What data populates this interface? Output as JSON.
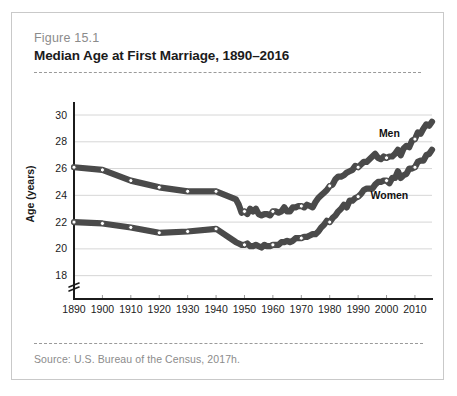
{
  "figure": {
    "number": "Figure 15.1",
    "title": "Median Age at First Marriage, 1890–2016",
    "source": "Source:  U.S. Bureau of the Census, 2017h."
  },
  "colors": {
    "line": "#4a4a4a",
    "marker_fill": "#ffffff",
    "gridline": "#d6d6d6",
    "axis": "#1b1b1b",
    "card_border": "#c9c9c9",
    "muted_text": "#8b8b8b"
  },
  "chart_data": {
    "type": "line",
    "title": "Median Age at First Marriage, 1890–2016",
    "xlabel": "",
    "ylabel": "Age (years)",
    "xlim": [
      1890,
      2016
    ],
    "ylim": [
      17,
      30.6
    ],
    "y_axis_break": true,
    "y_axis_break_note": "axis broken below 18",
    "grid": true,
    "legend": "inline-labels",
    "yticks": [
      18,
      20,
      22,
      24,
      26,
      28,
      30
    ],
    "xticks": [
      1890,
      1900,
      1910,
      1920,
      1930,
      1940,
      1950,
      1960,
      1970,
      1980,
      1990,
      2000,
      2010
    ],
    "marker_years": [
      1890,
      1900,
      1910,
      1920,
      1930,
      1940,
      1950,
      1960,
      1970,
      1980,
      1990,
      2000,
      2010
    ],
    "series": [
      {
        "name": "Men",
        "label": "Men",
        "label_year": 2001,
        "label_value": 28.6,
        "x": [
          1890,
          1900,
          1910,
          1920,
          1930,
          1940,
          1947,
          1948,
          1949,
          1950,
          1951,
          1952,
          1953,
          1954,
          1955,
          1956,
          1957,
          1958,
          1959,
          1960,
          1961,
          1962,
          1963,
          1964,
          1965,
          1966,
          1967,
          1968,
          1969,
          1970,
          1971,
          1972,
          1973,
          1974,
          1975,
          1976,
          1977,
          1978,
          1979,
          1980,
          1981,
          1982,
          1983,
          1984,
          1985,
          1986,
          1987,
          1988,
          1989,
          1990,
          1991,
          1992,
          1993,
          1994,
          1995,
          1996,
          1997,
          1998,
          1999,
          2000,
          2001,
          2002,
          2003,
          2004,
          2005,
          2006,
          2007,
          2008,
          2009,
          2010,
          2011,
          2012,
          2013,
          2014,
          2015,
          2016
        ],
        "y": [
          26.1,
          25.9,
          25.1,
          24.6,
          24.3,
          24.3,
          23.7,
          23.3,
          22.7,
          22.8,
          22.6,
          23.0,
          22.8,
          23.0,
          22.6,
          22.5,
          22.6,
          22.6,
          22.5,
          22.8,
          22.8,
          22.7,
          22.8,
          23.1,
          22.8,
          22.8,
          23.1,
          23.1,
          23.2,
          23.2,
          23.1,
          23.3,
          23.2,
          23.1,
          23.5,
          23.8,
          24.0,
          24.2,
          24.4,
          24.7,
          24.8,
          25.2,
          25.4,
          25.4,
          25.5,
          25.7,
          25.8,
          25.9,
          26.2,
          26.1,
          26.3,
          26.5,
          26.5,
          26.7,
          26.9,
          27.1,
          26.8,
          26.7,
          26.9,
          26.8,
          26.9,
          26.9,
          27.1,
          27.4,
          27.0,
          27.5,
          27.7,
          27.6,
          28.1,
          28.2,
          28.7,
          28.6,
          29.0,
          29.3,
          29.2,
          29.5
        ]
      },
      {
        "name": "Women",
        "label": "Women",
        "label_year": 2001,
        "label_value": 24.0,
        "x": [
          1890,
          1900,
          1910,
          1920,
          1930,
          1940,
          1947,
          1948,
          1949,
          1950,
          1951,
          1952,
          1953,
          1954,
          1955,
          1956,
          1957,
          1958,
          1959,
          1960,
          1961,
          1962,
          1963,
          1964,
          1965,
          1966,
          1967,
          1968,
          1969,
          1970,
          1971,
          1972,
          1973,
          1974,
          1975,
          1976,
          1977,
          1978,
          1979,
          1980,
          1981,
          1982,
          1983,
          1984,
          1985,
          1986,
          1987,
          1988,
          1989,
          1990,
          1991,
          1992,
          1993,
          1994,
          1995,
          1996,
          1997,
          1998,
          1999,
          2000,
          2001,
          2002,
          2003,
          2004,
          2005,
          2006,
          2007,
          2008,
          2009,
          2010,
          2011,
          2012,
          2013,
          2014,
          2015,
          2016
        ],
        "y": [
          22.0,
          21.9,
          21.6,
          21.2,
          21.3,
          21.5,
          20.5,
          20.4,
          20.3,
          20.3,
          20.4,
          20.2,
          20.2,
          20.3,
          20.2,
          20.1,
          20.3,
          20.2,
          20.2,
          20.3,
          20.3,
          20.3,
          20.5,
          20.5,
          20.6,
          20.5,
          20.6,
          20.8,
          20.8,
          20.8,
          20.9,
          20.9,
          21.0,
          21.1,
          21.1,
          21.3,
          21.6,
          21.8,
          22.1,
          22.0,
          22.3,
          22.5,
          22.8,
          23.0,
          23.3,
          23.1,
          23.6,
          23.6,
          23.8,
          23.9,
          24.1,
          24.4,
          24.5,
          24.5,
          24.5,
          24.8,
          25.0,
          25.0,
          25.1,
          25.1,
          24.9,
          25.3,
          25.3,
          25.8,
          25.3,
          25.5,
          25.6,
          26.0,
          26.0,
          26.1,
          26.5,
          26.6,
          26.6,
          27.0,
          27.1,
          27.4
        ]
      }
    ]
  }
}
